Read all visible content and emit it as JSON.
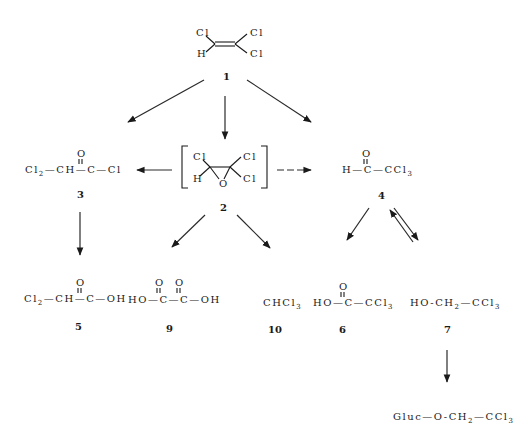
{
  "diagram": {
    "type": "metabolic-pathway",
    "compounds": {
      "c1": {
        "number": "1",
        "atoms": {
          "cl_top_left": "Cl",
          "h": "H",
          "cl_top_right": "Cl",
          "cl_bottom_right": "Cl"
        }
      },
      "c2": {
        "number": "2",
        "atoms": {
          "cl_left": "Cl",
          "h": "H",
          "o": "O",
          "cl_top_right": "Cl",
          "cl_bottom_right": "Cl"
        }
      },
      "c3": {
        "number": "3",
        "formula": {
          "a": "Cl",
          "a_sub": "2",
          "b": "—CH—",
          "c": "C",
          "d": "—Cl",
          "o": "O"
        }
      },
      "c4": {
        "number": "4",
        "formula": {
          "a": "H—",
          "c": "C",
          "d": "—CCl",
          "d_sub": "3",
          "o": "O"
        }
      },
      "c5": {
        "number": "5",
        "formula": {
          "a": "Cl",
          "a_sub": "2",
          "b": "—CH—",
          "c": "C",
          "d": "—OH",
          "o": "O"
        }
      },
      "c9": {
        "number": "9",
        "formula": {
          "a": "HO—",
          "c1": "C",
          "mid": "—",
          "c2": "C",
          "d": "—OH",
          "o": "O"
        }
      },
      "c10": {
        "number": "10",
        "formula": {
          "a": "CHCl",
          "a_sub": "3"
        }
      },
      "c6": {
        "number": "6",
        "formula": {
          "a": "HO—",
          "c": "C",
          "d": "—CCl",
          "d_sub": "3",
          "o": "O"
        }
      },
      "c7": {
        "number": "7",
        "formula": {
          "a": "HO-CH",
          "a_sub": "2",
          "d": "—CCl",
          "d_sub": "3"
        }
      },
      "gluc": {
        "formula": {
          "a": "Gluc—O-CH",
          "a_sub": "2",
          "d": "—CCl",
          "d_sub": "3"
        }
      }
    },
    "edges": [
      {
        "from": "1",
        "to": "3",
        "style": "solid"
      },
      {
        "from": "1",
        "to": "2",
        "style": "solid"
      },
      {
        "from": "1",
        "to": "4",
        "style": "solid"
      },
      {
        "from": "2",
        "to": "3",
        "style": "solid"
      },
      {
        "from": "2",
        "to": "4",
        "style": "dashed"
      },
      {
        "from": "3",
        "to": "5",
        "style": "solid"
      },
      {
        "from": "2",
        "to": "9",
        "style": "solid"
      },
      {
        "from": "2",
        "to": "10",
        "style": "solid"
      },
      {
        "from": "4",
        "to": "6",
        "style": "solid"
      },
      {
        "from": "4",
        "to": "7",
        "style": "equilibrium"
      },
      {
        "from": "7",
        "to": "Gluc-O-CH2-CCl3",
        "style": "solid"
      }
    ]
  }
}
